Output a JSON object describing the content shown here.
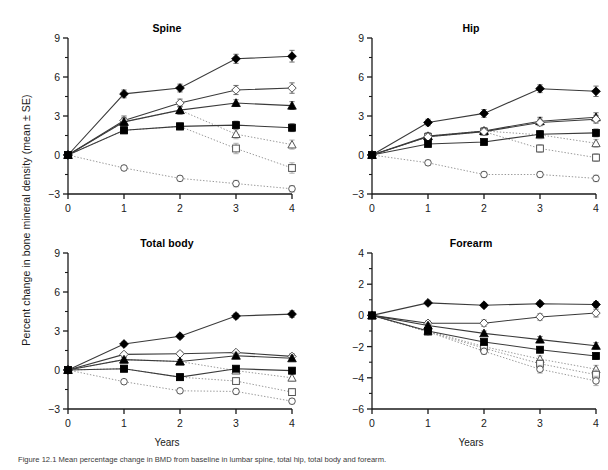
{
  "figure": {
    "ylabel": "Percent change in bone mineral density (mean ± SE)",
    "xlabel": "Years",
    "caption": "Figure 12.1  Mean percentage change in BMD from baseline in lumbar spine, total hip, total body and forearm.",
    "axis_color": "#1a1a1a"
  },
  "chart_data": [
    {
      "type": "line",
      "title": "Spine",
      "xlabel": "Years",
      "ylabel": "Percent change in bone mineral density (mean ± SE)",
      "x": [
        0,
        1,
        2,
        3,
        4
      ],
      "xlim": [
        0,
        4
      ],
      "ylim": [
        -3,
        9
      ],
      "yticks": [
        -3,
        0,
        3,
        6,
        9
      ],
      "xticks": [
        0,
        1,
        2,
        3,
        4
      ],
      "grid": false,
      "series": [
        {
          "name": "filled-diamond",
          "marker": "filled-diamond",
          "linestyle": "solid",
          "values": [
            0,
            4.7,
            5.15,
            7.4,
            7.6
          ],
          "errors": [
            0,
            0.3,
            0.3,
            0.35,
            0.45
          ]
        },
        {
          "name": "open-diamond",
          "marker": "open-diamond",
          "linestyle": "solid",
          "values": [
            0,
            2.65,
            4.0,
            5.0,
            5.15
          ],
          "errors": [
            0,
            0.35,
            0.3,
            0.35,
            0.4
          ]
        },
        {
          "name": "filled-triangle",
          "marker": "filled-triangle",
          "linestyle": "solid",
          "values": [
            0,
            2.55,
            3.45,
            4.0,
            3.8
          ],
          "errors": [
            0,
            0.3,
            0.3,
            0.25,
            0.3
          ]
        },
        {
          "name": "filled-square",
          "marker": "filled-square",
          "linestyle": "solid",
          "values": [
            0,
            1.9,
            2.2,
            2.3,
            2.1
          ],
          "errors": [
            0,
            0.25,
            0.25,
            0.3,
            0.3
          ]
        },
        {
          "name": "open-triangle",
          "marker": "open-triangle",
          "linestyle": "dotted",
          "values": [
            0,
            2.55,
            3.45,
            1.6,
            0.8
          ],
          "errors": [
            0,
            0.3,
            0.3,
            0.35,
            0.35
          ]
        },
        {
          "name": "open-square",
          "marker": "open-square",
          "linestyle": "dotted",
          "values": [
            0,
            1.9,
            2.2,
            0.5,
            -1.0
          ],
          "errors": [
            0,
            0.25,
            0.25,
            0.4,
            0.4
          ]
        },
        {
          "name": "open-circle",
          "marker": "open-circle",
          "linestyle": "dotted",
          "values": [
            0,
            -1.0,
            -1.8,
            -2.2,
            -2.6
          ],
          "errors": [
            0,
            0.2,
            0.2,
            0.25,
            0.25
          ]
        }
      ]
    },
    {
      "type": "line",
      "title": "Hip",
      "xlabel": "Years",
      "ylabel": "",
      "x": [
        0,
        1,
        2,
        3,
        4
      ],
      "xlim": [
        0,
        4
      ],
      "ylim": [
        -3,
        9
      ],
      "yticks": [
        -3,
        0,
        3,
        6,
        9
      ],
      "xticks": [
        0,
        1,
        2,
        3,
        4
      ],
      "grid": false,
      "series": [
        {
          "name": "filled-diamond",
          "marker": "filled-diamond",
          "linestyle": "solid",
          "values": [
            0,
            2.5,
            3.2,
            5.1,
            4.9
          ],
          "errors": [
            0,
            0.25,
            0.3,
            0.3,
            0.4
          ]
        },
        {
          "name": "filled-triangle",
          "marker": "filled-triangle",
          "linestyle": "solid",
          "values": [
            0,
            1.45,
            1.85,
            2.6,
            2.9
          ],
          "errors": [
            0,
            0.25,
            0.25,
            0.3,
            0.35
          ]
        },
        {
          "name": "open-diamond",
          "marker": "open-diamond",
          "linestyle": "solid",
          "values": [
            0,
            1.4,
            1.8,
            2.5,
            2.75
          ],
          "errors": [
            0,
            0.25,
            0.25,
            0.25,
            0.3
          ]
        },
        {
          "name": "filled-square",
          "marker": "filled-square",
          "linestyle": "solid",
          "values": [
            0,
            0.85,
            1.0,
            1.6,
            1.7
          ],
          "errors": [
            0,
            0.2,
            0.2,
            0.25,
            0.3
          ]
        },
        {
          "name": "open-triangle",
          "marker": "open-triangle",
          "linestyle": "dotted",
          "values": [
            0,
            1.45,
            1.85,
            1.55,
            0.9
          ],
          "errors": [
            0,
            0.25,
            0.25,
            0.3,
            0.3
          ]
        },
        {
          "name": "open-square",
          "marker": "open-square",
          "linestyle": "dotted",
          "values": [
            0,
            1.4,
            1.8,
            0.5,
            -0.2
          ],
          "errors": [
            0,
            0.25,
            0.25,
            0.3,
            0.3
          ]
        },
        {
          "name": "open-circle",
          "marker": "open-circle",
          "linestyle": "dotted",
          "values": [
            0,
            -0.6,
            -1.5,
            -1.5,
            -1.8
          ],
          "errors": [
            0,
            0.2,
            0.2,
            0.2,
            0.25
          ]
        }
      ]
    },
    {
      "type": "line",
      "title": "Total body",
      "xlabel": "Years",
      "ylabel": "",
      "x": [
        0,
        1,
        2,
        3,
        4
      ],
      "xlim": [
        0,
        4
      ],
      "ylim": [
        -3,
        9
      ],
      "yticks": [
        -3,
        0,
        3,
        6,
        9
      ],
      "xticks": [
        0,
        1,
        2,
        3,
        4
      ],
      "grid": false,
      "series": [
        {
          "name": "filled-diamond",
          "marker": "filled-diamond",
          "linestyle": "solid",
          "values": [
            0,
            2.0,
            2.6,
            4.15,
            4.3
          ],
          "errors": [
            0,
            0.15,
            0.15,
            0.2,
            0.25
          ]
        },
        {
          "name": "open-diamond",
          "marker": "open-diamond",
          "linestyle": "solid",
          "values": [
            0,
            1.2,
            1.25,
            1.35,
            1.05
          ],
          "errors": [
            0,
            0.15,
            0.15,
            0.15,
            0.2
          ]
        },
        {
          "name": "filled-triangle",
          "marker": "filled-triangle",
          "linestyle": "solid",
          "values": [
            0,
            0.8,
            0.65,
            1.1,
            0.9
          ],
          "errors": [
            0,
            0.15,
            0.15,
            0.2,
            0.2
          ]
        },
        {
          "name": "filled-square",
          "marker": "filled-square",
          "linestyle": "solid",
          "values": [
            0,
            0.1,
            -0.55,
            0.1,
            -0.05
          ],
          "errors": [
            0,
            0.15,
            0.15,
            0.2,
            0.2
          ]
        },
        {
          "name": "open-triangle",
          "marker": "open-triangle",
          "linestyle": "dotted",
          "values": [
            0,
            0.8,
            0.65,
            -0.05,
            -0.6
          ],
          "errors": [
            0,
            0.15,
            0.15,
            0.2,
            0.25
          ]
        },
        {
          "name": "open-square",
          "marker": "open-square",
          "linestyle": "dotted",
          "values": [
            0,
            0.1,
            -0.55,
            -0.85,
            -1.7
          ],
          "errors": [
            0,
            0.15,
            0.15,
            0.2,
            0.25
          ]
        },
        {
          "name": "open-circle",
          "marker": "open-circle",
          "linestyle": "dotted",
          "values": [
            0,
            -0.9,
            -1.6,
            -1.65,
            -2.4
          ],
          "errors": [
            0,
            0.15,
            0.15,
            0.2,
            0.2
          ]
        }
      ]
    },
    {
      "type": "line",
      "title": "Forearm",
      "xlabel": "Years",
      "ylabel": "",
      "x": [
        0,
        1,
        2,
        3,
        4
      ],
      "xlim": [
        -6,
        4
      ],
      "ylim": [
        -6,
        4
      ],
      "yticks": [
        -6,
        -4,
        -2,
        0,
        2,
        4
      ],
      "xticks": [
        0,
        1,
        2,
        3,
        4
      ],
      "grid": false,
      "series": [
        {
          "name": "filled-diamond",
          "marker": "filled-diamond",
          "linestyle": "solid",
          "values": [
            0,
            0.8,
            0.65,
            0.75,
            0.7
          ],
          "errors": [
            0,
            0.12,
            0.12,
            0.15,
            0.18
          ]
        },
        {
          "name": "open-diamond",
          "marker": "open-diamond",
          "linestyle": "solid",
          "values": [
            0,
            -0.5,
            -0.5,
            -0.1,
            0.15
          ],
          "errors": [
            0,
            0.15,
            0.2,
            0.2,
            0.25
          ]
        },
        {
          "name": "filled-triangle",
          "marker": "filled-triangle",
          "linestyle": "solid",
          "values": [
            0,
            -0.65,
            -1.15,
            -1.55,
            -1.95
          ],
          "errors": [
            0,
            0.15,
            0.15,
            0.2,
            0.2
          ]
        },
        {
          "name": "filled-square",
          "marker": "filled-square",
          "linestyle": "solid",
          "values": [
            0,
            -1.0,
            -1.7,
            -2.2,
            -2.6
          ],
          "errors": [
            0,
            0.15,
            0.15,
            0.2,
            0.2
          ]
        },
        {
          "name": "open-triangle",
          "marker": "open-triangle",
          "linestyle": "dotted",
          "values": [
            0,
            -1.0,
            -2.0,
            -2.8,
            -3.45
          ],
          "errors": [
            0,
            0.15,
            0.2,
            0.2,
            0.25
          ]
        },
        {
          "name": "open-square",
          "marker": "open-square",
          "linestyle": "dotted",
          "values": [
            0,
            -1.05,
            -2.1,
            -3.1,
            -3.8
          ],
          "errors": [
            0,
            0.15,
            0.2,
            0.25,
            0.3
          ]
        },
        {
          "name": "open-circle",
          "marker": "open-circle",
          "linestyle": "dotted",
          "values": [
            0,
            -1.05,
            -2.3,
            -3.45,
            -4.2
          ],
          "errors": [
            0,
            0.15,
            0.2,
            0.25,
            0.3
          ]
        }
      ]
    }
  ]
}
